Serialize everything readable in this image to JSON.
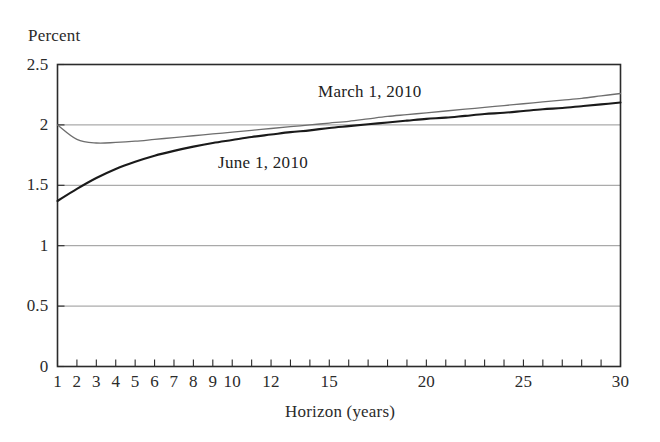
{
  "figure": {
    "ylabel": "Percent",
    "xlabel": "Horizon (years)",
    "label_march": "March 1, 2010",
    "label_june": "June 1, 2010"
  },
  "colors": {
    "series_march": "#6e6e6e",
    "series_june": "#1a1a1a",
    "axis": "#2b2b2b",
    "grid": "#8a8a8a",
    "background": "#ffffff"
  },
  "axes": {
    "y_ticks": [
      "0",
      "0.5",
      "1",
      "1.5",
      "2",
      "2.5"
    ],
    "x_ticks": [
      "1",
      "2",
      "3",
      "4",
      "5",
      "6",
      "7",
      "8",
      "9",
      "10",
      "12",
      "15",
      "20",
      "25",
      "30"
    ]
  },
  "chart_data": {
    "type": "line",
    "title": "",
    "xlabel": "Horizon (years)",
    "ylabel": "Percent",
    "xlim": [
      1,
      30
    ],
    "ylim": [
      0,
      2.5
    ],
    "grid": true,
    "legend_position": "inline-annotation",
    "x": [
      1,
      2,
      3,
      4,
      5,
      6,
      7,
      8,
      9,
      10,
      11,
      12,
      13,
      14,
      15,
      16,
      17,
      18,
      19,
      20,
      21,
      22,
      23,
      24,
      25,
      26,
      27,
      28,
      29,
      30
    ],
    "series": [
      {
        "name": "March 1, 2010",
        "color": "#6e6e6e",
        "values": [
          2.0,
          1.88,
          1.85,
          1.855,
          1.865,
          1.88,
          1.895,
          1.91,
          1.925,
          1.94,
          1.955,
          1.97,
          1.985,
          2.0,
          2.015,
          2.03,
          2.05,
          2.07,
          2.085,
          2.1,
          2.115,
          2.13,
          2.145,
          2.16,
          2.175,
          2.19,
          2.205,
          2.22,
          2.24,
          2.26
        ]
      },
      {
        "name": "June 1, 2010",
        "color": "#1a1a1a",
        "values": [
          1.37,
          1.47,
          1.56,
          1.635,
          1.695,
          1.745,
          1.785,
          1.82,
          1.85,
          1.875,
          1.9,
          1.92,
          1.94,
          1.955,
          1.975,
          1.99,
          2.005,
          2.02,
          2.035,
          2.05,
          2.06,
          2.075,
          2.09,
          2.1,
          2.115,
          2.13,
          2.14,
          2.155,
          2.17,
          2.185
        ]
      }
    ],
    "annotations": [
      {
        "text": "March 1, 2010",
        "x": 18,
        "y": 2.26
      },
      {
        "text": "June 1, 2010",
        "x": 10,
        "y": 1.72
      }
    ]
  }
}
